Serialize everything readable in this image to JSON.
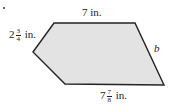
{
  "figure": {
    "shape": "pentagon",
    "fill_color": "#e3e3e3",
    "stroke_color": "#222222",
    "vertices": [
      [
        54,
        23
      ],
      [
        135,
        23
      ],
      [
        164,
        85
      ],
      [
        65,
        84
      ],
      [
        33,
        52
      ]
    ]
  },
  "labels": {
    "top": {
      "whole": "7",
      "unit": "in."
    },
    "left": {
      "whole": "2",
      "num": "3",
      "den": "4",
      "unit": "in."
    },
    "right": {
      "text": "b"
    },
    "bottom": {
      "whole": "7",
      "num": "7",
      "den": "8",
      "unit": "in."
    }
  }
}
